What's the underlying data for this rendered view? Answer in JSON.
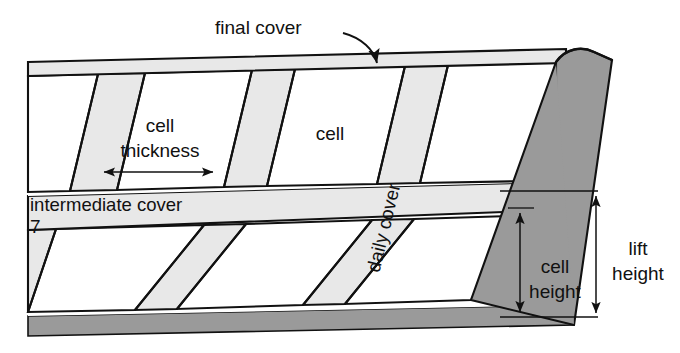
{
  "figure": {
    "type": "engineering-cross-section-diagram",
    "width": 680,
    "height": 353
  },
  "colors": {
    "background": "#ffffff",
    "cover_fill": "#e8e8e8",
    "working_face_fill": "#9a9a9a",
    "base_fill": "#9a9a9a",
    "cell_fill": "#ffffff",
    "outline": "#111111",
    "text": "#111111"
  },
  "labels": {
    "final_cover": "final cover",
    "cell_thickness": "cell thickness",
    "cell_thickness_line1": "cell",
    "cell_thickness_line2": "thickness",
    "cell": "cell",
    "daily_cover": "daily cover",
    "intermediate_cover": "intermediate cover",
    "cell_height_line1": "cell",
    "cell_height_line2": "height",
    "lift_height_line1": "lift",
    "lift_height_line2": "height",
    "artifact_mark": "7"
  },
  "annotations": [
    {
      "name": "final-cover",
      "text": "final cover",
      "kind": "leader-arrow",
      "target": "top cover band"
    },
    {
      "name": "cell-thickness",
      "text": "cell thickness",
      "kind": "horizontal-double-arrow",
      "target": "width of one cell in upper lift"
    },
    {
      "name": "cell",
      "text": "cell",
      "kind": "inline-label",
      "target": "second cell of upper lift"
    },
    {
      "name": "daily-cover",
      "text": "daily cover",
      "kind": "rotated-inline-label",
      "target": "slanted cover strip"
    },
    {
      "name": "intermediate-cover",
      "text": "intermediate cover",
      "kind": "inline-label",
      "target": "horizontal middle cover band"
    },
    {
      "name": "cell-height",
      "text": "cell height",
      "kind": "vertical-dimension",
      "target": "height of one cell"
    },
    {
      "name": "lift-height",
      "text": "lift height",
      "kind": "vertical-dimension",
      "target": "height of full lift"
    }
  ],
  "structure": {
    "lifts": 2,
    "upper_lift_cells": 4,
    "lower_lift_cells": 3,
    "cover_bands": [
      "final cover",
      "intermediate cover",
      "daily cover"
    ],
    "working_face": "exposed sloping face at right, shaded dark gray",
    "base": "dark gray liner band at bottom"
  }
}
